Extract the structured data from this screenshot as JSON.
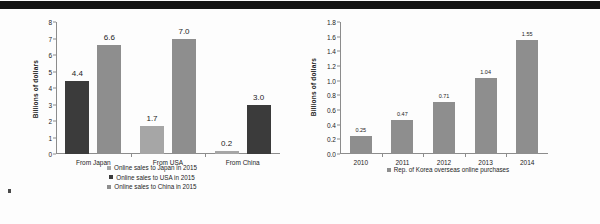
{
  "banner": {
    "color": "#141414"
  },
  "chart_data": [
    {
      "id": "left",
      "type": "bar",
      "title": "",
      "xlabel": "",
      "ylabel": "Billions of dollars",
      "ylim": [
        0,
        8
      ],
      "ytick_step": 1,
      "yticks": [
        "0",
        "1",
        "2",
        "3",
        "4",
        "5",
        "6",
        "7",
        "8"
      ],
      "categories": [
        "From Japan",
        "From USA",
        "From China"
      ],
      "grid": false,
      "legend_position": "bottom",
      "series": [
        {
          "name": "Online sales to Japan in 2015",
          "color": "#a6a6a6",
          "values": [
            null,
            1.7,
            0.2
          ],
          "labels": [
            "",
            "1.7",
            "0.2"
          ]
        },
        {
          "name": "Online sales to USA in 2015",
          "color": "#3b3b3b",
          "values": [
            4.4,
            null,
            3.0
          ],
          "labels": [
            "4.4",
            "",
            "3.0"
          ]
        },
        {
          "name": "Online sales to China in 2015",
          "color": "#8e8e8e",
          "values": [
            6.6,
            7.0,
            null
          ],
          "labels": [
            "6.6",
            "7.0",
            ""
          ]
        }
      ],
      "bars": [
        {
          "group": "From Japan",
          "label": "4.4",
          "value": 4.4,
          "color": "#3b3b3b"
        },
        {
          "group": "From Japan",
          "label": "6.6",
          "value": 6.6,
          "color": "#8e8e8e"
        },
        {
          "group": "From USA",
          "label": "1.7",
          "value": 1.7,
          "color": "#a6a6a6"
        },
        {
          "group": "From USA",
          "label": "7.0",
          "value": 7.0,
          "color": "#8e8e8e"
        },
        {
          "group": "From China",
          "label": "0.2",
          "value": 0.2,
          "color": "#a6a6a6"
        },
        {
          "group": "From China",
          "label": "3.0",
          "value": 3.0,
          "color": "#3b3b3b"
        }
      ]
    },
    {
      "id": "right",
      "type": "bar",
      "title": "",
      "xlabel": "",
      "ylabel": "Billions of dollars",
      "ylim": [
        0,
        1.8
      ],
      "ytick_step": 0.2,
      "yticks": [
        "0.0",
        "0.2",
        "0.4",
        "0.6",
        "0.8",
        "1.0",
        "1.2",
        "1.4",
        "1.6",
        "1.8"
      ],
      "categories": [
        "2010",
        "2011",
        "2012",
        "2013",
        "2014"
      ],
      "grid": false,
      "legend_position": "bottom",
      "series": [
        {
          "name": "Rep. of Korea overseas online purchases",
          "color": "#8e8e8e",
          "values": [
            0.25,
            0.47,
            0.71,
            1.04,
            1.55
          ],
          "labels": [
            "0.25",
            "0.47",
            "0.71",
            "1.04",
            "1.55"
          ]
        }
      ]
    }
  ]
}
